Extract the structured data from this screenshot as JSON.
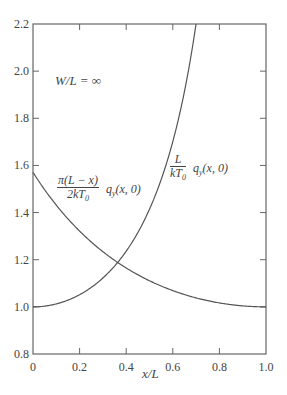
{
  "chart_data": {
    "type": "line",
    "title": "",
    "xlabel": "x/L",
    "ylabel": "",
    "xlim": [
      0,
      1.0
    ],
    "ylim": [
      0.8,
      2.2
    ],
    "xticks": [
      "0",
      "0.2",
      "0.4",
      "0.6",
      "0.8",
      "1.0"
    ],
    "yticks": [
      "0.8",
      "1.0",
      "1.2",
      "1.4",
      "1.6",
      "1.8",
      "2.0",
      "2.2"
    ],
    "grid": false,
    "annotation": "W/L = ∞",
    "series": [
      {
        "name": "π(L − x)/(2kT₀) q_y(x, 0)",
        "x": [
          0,
          0.1,
          0.2,
          0.3,
          0.365,
          0.4,
          0.5,
          0.6,
          0.7,
          0.8,
          0.9,
          1.0
        ],
        "values": [
          1.571,
          1.454,
          1.352,
          1.262,
          1.188,
          1.168,
          1.111,
          1.065,
          1.036,
          1.016,
          1.004,
          1.0
        ]
      },
      {
        "name": "L/(kT₀) q_y(x, 0)",
        "x": [
          0,
          0.1,
          0.2,
          0.3,
          0.365,
          0.4,
          0.5,
          0.6,
          0.65,
          0.7
        ],
        "values": [
          1.0,
          1.012,
          1.051,
          1.122,
          1.19,
          1.236,
          1.414,
          1.701,
          1.916,
          2.203
        ]
      }
    ]
  },
  "labels": {
    "annotation": "W/L = ∞",
    "xlabel": "x/L",
    "curve1_num": "π(L − x)",
    "curve1_den": "2kT",
    "curve1_den_sub": "0",
    "curve1_tail": "q",
    "curve1_tail_sub": "y",
    "curve1_tail_args": "(x, 0)",
    "curve2_num": "L",
    "curve2_den": "kT",
    "curve2_den_sub": "0",
    "curve2_tail": "q",
    "curve2_tail_sub": "y",
    "curve2_tail_args": "(x, 0)"
  }
}
